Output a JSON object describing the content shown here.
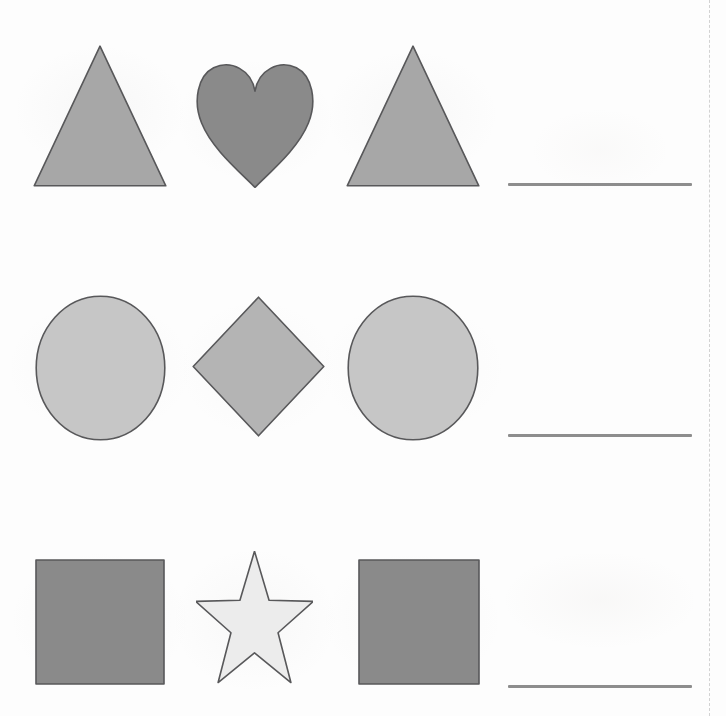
{
  "document": {
    "type": "shape-pattern-worksheet",
    "title": "Shape Patterns",
    "page_background": "#fdfdfd",
    "rows": 3,
    "columns": 4,
    "scan_edge": "dashed-right-margin"
  },
  "colors": {
    "shape_fill_light": "#c6c6c6",
    "shape_fill_medium": "#a7a7a7",
    "shape_fill_dark": "#8a8a8a",
    "shape_fill_pale": "#ececec",
    "shape_outline": "#58585a",
    "answer_line": "#8d8d8d",
    "paper": "#fdfdfd",
    "scan_edge": "#d2d2d2"
  },
  "rows": [
    {
      "id": "row-1",
      "pattern_name": "triangle-heart-triangle",
      "answer_blank_label": "",
      "cells": [
        {
          "slot": 1,
          "shape": "triangle",
          "icon_name": "triangle-icon",
          "fill": "#a7a7a7",
          "outline": "#58585a",
          "x": 33,
          "y": 45,
          "w": 134,
          "h": 142
        },
        {
          "slot": 2,
          "shape": "heart",
          "icon_name": "heart-icon",
          "fill": "#8a8a8a",
          "outline": "#58585a",
          "x": 195,
          "y": 58,
          "w": 120,
          "h": 130
        },
        {
          "slot": 3,
          "shape": "triangle",
          "icon_name": "triangle-icon",
          "fill": "#a7a7a7",
          "outline": "#58585a",
          "x": 346,
          "y": 45,
          "w": 134,
          "h": 142
        },
        {
          "slot": 4,
          "shape": "answer-blank",
          "icon_name": "answer-line",
          "x": 508,
          "y": 183,
          "w": 184,
          "h": 3
        }
      ]
    },
    {
      "id": "row-2",
      "pattern_name": "circle-diamond-circle",
      "answer_blank_label": "",
      "cells": [
        {
          "slot": 1,
          "shape": "circle",
          "icon_name": "circle-icon",
          "fill": "#c6c6c6",
          "outline": "#58585a",
          "x": 35,
          "y": 295,
          "w": 131,
          "h": 146
        },
        {
          "slot": 2,
          "shape": "diamond",
          "icon_name": "diamond-icon",
          "fill": "#b4b4b4",
          "outline": "#58585a",
          "x": 192,
          "y": 296,
          "w": 133,
          "h": 141
        },
        {
          "slot": 3,
          "shape": "circle",
          "icon_name": "circle-icon",
          "fill": "#c6c6c6",
          "outline": "#58585a",
          "x": 347,
          "y": 295,
          "w": 132,
          "h": 146
        },
        {
          "slot": 4,
          "shape": "answer-blank",
          "icon_name": "answer-line",
          "x": 508,
          "y": 434,
          "w": 184,
          "h": 3
        }
      ]
    },
    {
      "id": "row-3",
      "pattern_name": "square-star-square",
      "answer_blank_label": "",
      "cells": [
        {
          "slot": 1,
          "shape": "square",
          "icon_name": "square-icon",
          "fill": "#8a8a8a",
          "outline": "#58585a",
          "x": 35,
          "y": 559,
          "w": 130,
          "h": 126
        },
        {
          "slot": 2,
          "shape": "star",
          "icon_name": "star-icon",
          "fill": "#ececec",
          "outline": "#58585a",
          "x": 196,
          "y": 551,
          "w": 117,
          "h": 140
        },
        {
          "slot": 3,
          "shape": "square",
          "icon_name": "square-icon",
          "fill": "#8a8a8a",
          "outline": "#58585a",
          "x": 358,
          "y": 559,
          "w": 122,
          "h": 126
        },
        {
          "slot": 4,
          "shape": "answer-blank",
          "icon_name": "answer-line",
          "x": 508,
          "y": 685,
          "w": 184,
          "h": 3
        }
      ]
    }
  ]
}
